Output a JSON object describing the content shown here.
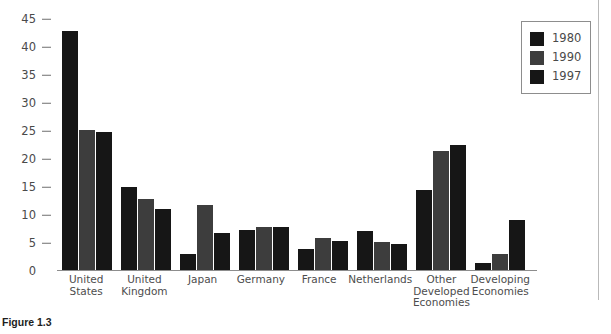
{
  "figure": {
    "caption": "Figure 1.3"
  },
  "chart_data": {
    "type": "bar",
    "title": "",
    "xlabel": "",
    "ylabel": "",
    "ylim": [
      0,
      45
    ],
    "yticks": [
      0,
      5,
      10,
      15,
      20,
      25,
      30,
      35,
      40,
      45
    ],
    "grid": false,
    "legend_position": "top-right",
    "categories": [
      "United\nStates",
      "United\nKingdom",
      "Japan",
      "Germany",
      "France",
      "Netherlands",
      "Other\nDeveloped\nEconomies",
      "Developing\nEconomies"
    ],
    "series": [
      {
        "name": "1980",
        "color": "#161616",
        "values": [
          42.6,
          14.9,
          2.9,
          7.2,
          3.8,
          6.9,
          14.3,
          1.2
        ]
      },
      {
        "name": "1990",
        "color": "#3d3d3d",
        "values": [
          25.0,
          12.6,
          11.6,
          7.6,
          5.7,
          5.0,
          21.2,
          2.8
        ]
      },
      {
        "name": "1997",
        "color": "#161616",
        "values": [
          24.7,
          10.9,
          6.6,
          7.7,
          5.1,
          4.7,
          22.4,
          8.9
        ]
      }
    ]
  }
}
